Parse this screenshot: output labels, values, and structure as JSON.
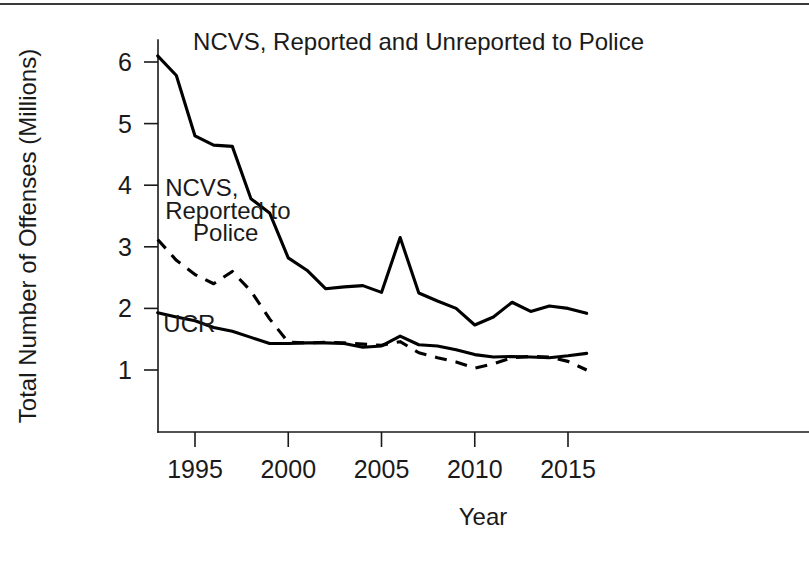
{
  "chart_data": {
    "type": "line",
    "title": "",
    "xlabel": "Year",
    "ylabel": "Total Number of Offenses (Millions)",
    "xlim": [
      1992.7,
      2016.4
    ],
    "ylim": [
      0.35,
      6.45
    ],
    "grid": false,
    "legend_position": "inline-annotations",
    "xticks": [
      1995,
      2000,
      2005,
      2010,
      2015
    ],
    "xtick_labels": [
      "1995",
      "2000",
      "2005",
      "2010",
      "2015"
    ],
    "yticks": [
      1,
      2,
      3,
      4,
      5,
      6
    ],
    "ytick_labels": [
      "1",
      "2",
      "3",
      "4",
      "5",
      "6"
    ],
    "x": [
      1993,
      1994,
      1995,
      1996,
      1997,
      1998,
      1999,
      2000,
      2001,
      2002,
      2003,
      2004,
      2005,
      2006,
      2007,
      2008,
      2009,
      2010,
      2011,
      2012,
      2013,
      2014,
      2015,
      2016
    ],
    "series": [
      {
        "name": "NCVS, Reported and Unreported to Police",
        "style": "solid",
        "color": "#000000",
        "values": [
          6.1,
          5.78,
          4.8,
          4.65,
          4.63,
          3.78,
          3.55,
          2.82,
          2.62,
          2.32,
          2.35,
          2.37,
          2.26,
          3.15,
          2.25,
          2.12,
          2.0,
          1.73,
          1.86,
          2.1,
          1.95,
          2.04,
          2.0,
          1.92
        ]
      },
      {
        "name": "NCVS, Reported to Police",
        "style": "dashed",
        "color": "#000000",
        "values": [
          3.12,
          2.78,
          2.55,
          2.4,
          2.6,
          2.28,
          1.83,
          1.45,
          1.44,
          1.45,
          1.44,
          1.42,
          1.4,
          1.46,
          1.28,
          1.2,
          1.13,
          1.03,
          1.1,
          1.2,
          1.22,
          1.21,
          1.14,
          1.0
        ]
      },
      {
        "name": "UCR",
        "style": "solid",
        "color": "#000000",
        "values": [
          1.93,
          1.86,
          1.8,
          1.69,
          1.63,
          1.53,
          1.43,
          1.43,
          1.44,
          1.44,
          1.43,
          1.37,
          1.39,
          1.55,
          1.41,
          1.39,
          1.33,
          1.25,
          1.21,
          1.22,
          1.21,
          1.2,
          1.23,
          1.27
        ]
      }
    ],
    "annotations": [
      {
        "name": "ncvs-total-label",
        "text": "NCVS, Reported and Unreported to Police",
        "x": 1994.9,
        "y": 6.2
      },
      {
        "name": "ncvs-reported-label-line1",
        "text": "NCVS,",
        "x": 1993.4,
        "y": 3.82
      },
      {
        "name": "ncvs-reported-label-line2",
        "text": "Reported to",
        "x": 1993.4,
        "y": 3.45
      },
      {
        "name": "ncvs-reported-label-line3",
        "text": "Police",
        "x": 1994.9,
        "y": 3.1
      },
      {
        "name": "ucr-label",
        "text": "UCR",
        "x": 1993.3,
        "y": 1.62
      }
    ]
  }
}
